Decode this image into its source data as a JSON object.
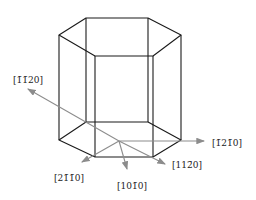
{
  "diagram": {
    "colors": {
      "edges": "#1a1a1a",
      "axes": "#8c8c8c",
      "text": "#222222"
    },
    "prism": {
      "top": [
        [
          86,
          18
        ],
        [
          148,
          18
        ],
        [
          181,
          35
        ],
        [
          153,
          56
        ],
        [
          95,
          56
        ],
        [
          59,
          35
        ]
      ],
      "bottom": [
        [
          86,
          122
        ],
        [
          148,
          122
        ],
        [
          181,
          140
        ],
        [
          153,
          157
        ],
        [
          95,
          157
        ],
        [
          59,
          140
        ]
      ]
    },
    "origin": [
      119,
      141
    ],
    "directions": [
      {
        "label": "[1̄1̄20]",
        "from": [
          119,
          141
        ],
        "to": [
          28,
          89
        ],
        "label_pos": [
          13,
          80
        ]
      },
      {
        "label": "[1̄21̄0]",
        "from": [
          119,
          141
        ],
        "to": [
          204,
          141
        ],
        "label_pos": [
          212,
          145
        ]
      },
      {
        "label": "[112̄0]",
        "from": [
          28,
          89
        ],
        "to": [
          165,
          164
        ],
        "label_pos": [
          172,
          167
        ]
      },
      {
        "label": "[21̄1̄0]",
        "from": [
          119,
          141
        ],
        "to": [
          82,
          162
        ],
        "label_pos": [
          54,
          180
        ]
      },
      {
        "label": "[101̄0]",
        "from": [
          119,
          141
        ],
        "to": [
          127,
          169
        ],
        "label_pos": [
          117,
          188
        ]
      }
    ]
  }
}
